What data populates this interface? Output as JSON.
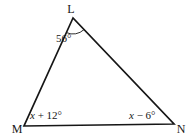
{
  "figure": {
    "kind": "triangle-angle-diagram",
    "background_color": "#ffffff",
    "line_color": "#161616",
    "vertices": {
      "top": {
        "label": "L"
      },
      "bottom_left": {
        "label": "M"
      },
      "bottom_right": {
        "label": "N"
      }
    },
    "angles": {
      "top": {
        "label": "56°"
      },
      "bottom_left": {
        "variable": "x",
        "expression": " + 12°"
      },
      "bottom_right": {
        "variable": "x",
        "expression": " − 6°"
      }
    }
  }
}
